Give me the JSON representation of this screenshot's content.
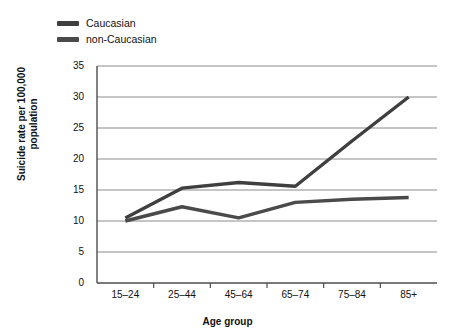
{
  "chart_data": {
    "type": "line",
    "title": "",
    "xlabel": "Age group",
    "ylabel": "Suicide rate per 100,000 population",
    "ylabel_line1": "Suicide rate per 100,000",
    "ylabel_line2": "population",
    "categories": [
      "15–24",
      "25–44",
      "45–64",
      "65–74",
      "75–84",
      "85+"
    ],
    "yticks": [
      0,
      5,
      10,
      15,
      20,
      25,
      30,
      35
    ],
    "ylim": [
      0,
      35
    ],
    "grid": true,
    "legend_position": "top-left",
    "series": [
      {
        "name": "Caucasian",
        "color": "#3f3f3f",
        "values": [
          10.5,
          15.3,
          16.2,
          15.6,
          22.9,
          30.0
        ]
      },
      {
        "name": "non-Caucasian",
        "color": "#4a4a4a",
        "values": [
          10.0,
          12.3,
          10.5,
          13.0,
          13.5,
          13.8
        ]
      }
    ]
  },
  "legend": {
    "items": [
      {
        "label": "Caucasian",
        "color": "#3f3f3f"
      },
      {
        "label": "non-Caucasian",
        "color": "#4a4a4a"
      }
    ]
  },
  "axes": {
    "y_tick_labels": [
      "35",
      "30",
      "25",
      "20",
      "15",
      "10",
      "5",
      "0"
    ],
    "x_tick_labels": [
      "15–24",
      "25–44",
      "45–64",
      "65–74",
      "75–84",
      "85+"
    ],
    "x_title": "Age group",
    "y_title_line1": "Suicide rate per 100,000",
    "y_title_line2": "population"
  },
  "colors": {
    "background": "#ffffff",
    "axis": "#4d4d4d",
    "grid": "#8c8c8c",
    "text": "#111111",
    "series_caucasian": "#3f3f3f",
    "series_non_caucasian": "#4a4a4a"
  }
}
